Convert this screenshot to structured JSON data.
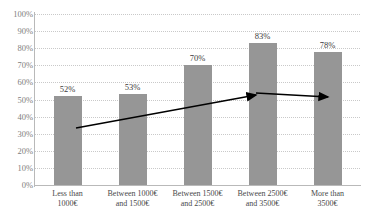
{
  "chart_data": {
    "type": "bar",
    "title": "",
    "subtitle": "",
    "xlabel": "",
    "ylabel": "",
    "ylim": [
      0,
      100
    ],
    "grid": true,
    "legend": "none",
    "y_ticks": [
      "0%",
      "10%",
      "20%",
      "30%",
      "40%",
      "50%",
      "60%",
      "70%",
      "80%",
      "90%",
      "100%"
    ],
    "y_tick_values": [
      0,
      10,
      20,
      30,
      40,
      50,
      60,
      70,
      80,
      90,
      100
    ],
    "categories": [
      "Less than 1000€",
      "Between 1000€ and 1500€",
      "Between 1500€ and 2500€",
      "Between 2500€ and 3500€",
      "More than 3500€"
    ],
    "category_lines": [
      [
        "Less than",
        "1000€"
      ],
      [
        "Between 1000€",
        "and 1500€"
      ],
      [
        "Between 1500€",
        "and 2500€"
      ],
      [
        "Between 2500€",
        "and 3500€"
      ],
      [
        "More than",
        "3500€"
      ]
    ],
    "values": [
      52,
      53,
      70,
      83,
      78
    ],
    "value_labels": [
      "52%",
      "53%",
      "70%",
      "83%",
      "78%"
    ],
    "bar_color": "#969696",
    "grid_color": "#c9c9c9",
    "axis_color": "#b9b9b9",
    "label_color": "#808080",
    "annotations": [
      {
        "name": "trend-arrow-rising",
        "type": "arrow",
        "color": "#000000",
        "from": {
          "x": 76,
          "y": 128
        },
        "to": {
          "x": 256,
          "y": 95
        }
      },
      {
        "name": "trend-arrow-flat",
        "type": "arrow",
        "color": "#000000",
        "from": {
          "x": 256,
          "y": 93
        },
        "to": {
          "x": 328,
          "y": 97
        }
      }
    ]
  }
}
